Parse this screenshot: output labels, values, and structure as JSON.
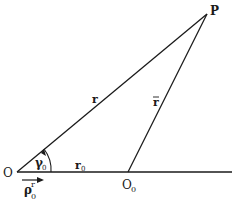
{
  "diagram": {
    "type": "geometry",
    "labels": {
      "P": "P",
      "O": "O",
      "O0_main": "O",
      "O0_sub": "0",
      "r": "r",
      "rbar": "r",
      "r0_main": "r",
      "r0_sub": "0",
      "gamma0_main": "γ",
      "gamma0_sub": "0",
      "rho_main": "ρ",
      "rho_sub": "0",
      "rho_sup": "r"
    },
    "points": {
      "O": [
        17,
        172
      ],
      "O0": [
        128,
        172
      ],
      "P": [
        207,
        14
      ],
      "axis_end": [
        232,
        172
      ]
    },
    "colors": {
      "ink": "#1a1a1a",
      "background": "#ffffff"
    }
  }
}
